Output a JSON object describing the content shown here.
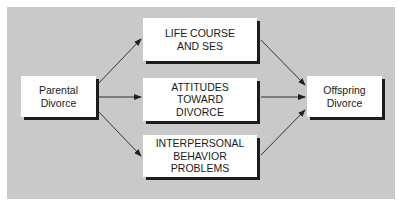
{
  "diagram": {
    "background_color": "#c9c9c9",
    "nodes": [
      {
        "id": "parental",
        "label": "Parental\nDivorce"
      },
      {
        "id": "lifecourse",
        "label": "LIFE COURSE\nAND SES"
      },
      {
        "id": "attitudes",
        "label": "ATTITUDES\nTOWARD\nDIVORCE"
      },
      {
        "id": "interpersonal",
        "label": "INTERPERSONAL\nBEHAVIOR\nPROBLEMS"
      },
      {
        "id": "offspring",
        "label": "Offspring\nDivorce"
      }
    ],
    "edges": [
      {
        "from": "parental",
        "to": "lifecourse"
      },
      {
        "from": "parental",
        "to": "attitudes"
      },
      {
        "from": "parental",
        "to": "interpersonal"
      },
      {
        "from": "lifecourse",
        "to": "offspring"
      },
      {
        "from": "attitudes",
        "to": "offspring"
      },
      {
        "from": "interpersonal",
        "to": "offspring"
      }
    ]
  }
}
